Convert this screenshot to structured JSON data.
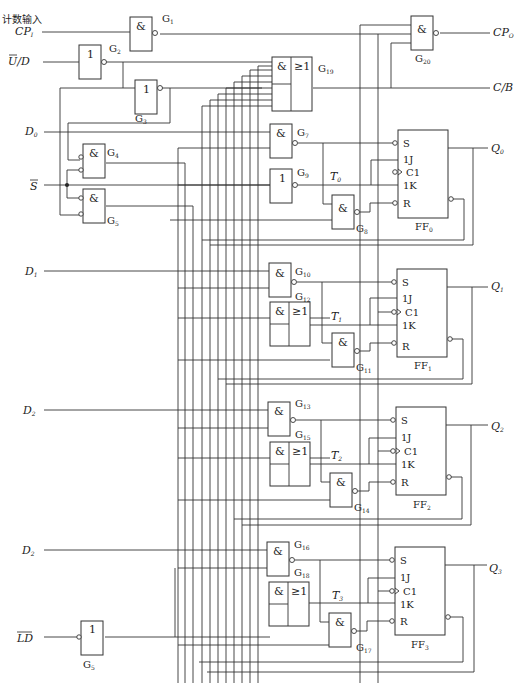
{
  "diagram": {
    "inputs": [
      {
        "id": "cpi",
        "caption": "计数输入",
        "label": "CP",
        "sub": "I"
      },
      {
        "id": "ud",
        "label": "U/D",
        "overbar": "U"
      },
      {
        "id": "d0",
        "label": "D",
        "sub": "0"
      },
      {
        "id": "s",
        "label": "S",
        "overbar": "S"
      },
      {
        "id": "d1",
        "label": "D",
        "sub": "1"
      },
      {
        "id": "d2",
        "label": "D",
        "sub": "2"
      },
      {
        "id": "d3",
        "label": "D",
        "sub": "2"
      },
      {
        "id": "ld",
        "label": "LD",
        "overbar": "LD"
      }
    ],
    "outputs": [
      {
        "id": "cpo",
        "label": "CP",
        "sub": "O"
      },
      {
        "id": "cb",
        "label": "C/B"
      },
      {
        "id": "q0",
        "label": "Q",
        "sub": "0"
      },
      {
        "id": "q1",
        "label": "Q",
        "sub": "1"
      },
      {
        "id": "q2",
        "label": "Q",
        "sub": "2"
      },
      {
        "id": "q3",
        "label": "Q",
        "sub": "3"
      }
    ],
    "gates": {
      "g1": {
        "name": "G",
        "sub": "1",
        "symbol": "&"
      },
      "g2": {
        "name": "G",
        "sub": "2",
        "symbol": "1"
      },
      "g3": {
        "name": "G",
        "sub": "3",
        "symbol": "1"
      },
      "g4": {
        "name": "G",
        "sub": "4",
        "symbol": "&"
      },
      "g5": {
        "name": "G",
        "sub": "5",
        "symbol": "&"
      },
      "g5b": {
        "name": "G",
        "sub": "5",
        "symbol": "1"
      },
      "g7": {
        "name": "G",
        "sub": "7",
        "symbol": "&"
      },
      "g8": {
        "name": "G",
        "sub": "8",
        "symbol": "&"
      },
      "g9": {
        "name": "G",
        "sub": "9",
        "symbol": "1"
      },
      "g10": {
        "name": "G",
        "sub": "10",
        "symbol": "&"
      },
      "g11": {
        "name": "G",
        "sub": "11",
        "symbol": "&"
      },
      "g12": {
        "name": "G",
        "sub": "12",
        "symbol_and": "&",
        "symbol_or": "≥1"
      },
      "g13": {
        "name": "G",
        "sub": "13",
        "symbol": "&"
      },
      "g14": {
        "name": "G",
        "sub": "14",
        "symbol": "&"
      },
      "g15": {
        "name": "G",
        "sub": "15",
        "symbol_and": "&",
        "symbol_or": "≥1"
      },
      "g16": {
        "name": "G",
        "sub": "16",
        "symbol": "&"
      },
      "g17": {
        "name": "G",
        "sub": "17",
        "symbol": "&"
      },
      "g18": {
        "name": "G",
        "sub": "18",
        "symbol_and": "&",
        "symbol_or": "≥1"
      },
      "g19": {
        "name": "G",
        "sub": "19",
        "symbol_and": "&",
        "symbol_or": "≥1"
      },
      "g20": {
        "name": "G",
        "sub": "20",
        "symbol": "&"
      }
    },
    "flipflops": [
      {
        "name": "FF",
        "sub": "0",
        "t": "T",
        "tsub": "0"
      },
      {
        "name": "FF",
        "sub": "1",
        "t": "T",
        "tsub": "1"
      },
      {
        "name": "FF",
        "sub": "2",
        "t": "T",
        "tsub": "2"
      },
      {
        "name": "FF",
        "sub": "3",
        "t": "T",
        "tsub": "3"
      }
    ],
    "ff_pins": {
      "s": "S",
      "j": "1J",
      "c": "C1",
      "k": "1K",
      "r": "R"
    }
  }
}
